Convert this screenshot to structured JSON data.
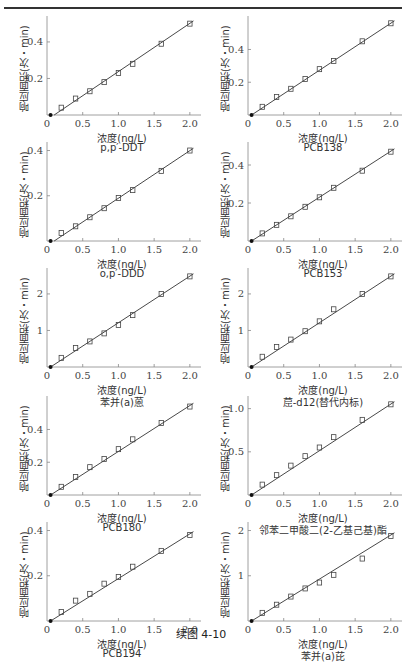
{
  "figure": {
    "caption": "续图 4-10",
    "xlabel": "浓度(ng/L)",
    "ylabel": "响应面积(次・min)"
  },
  "colors": {
    "line": "#333333",
    "marker": "#444444",
    "axis": "#888888",
    "text": "#333333"
  },
  "chart_data": [
    {
      "type": "scatter",
      "title": "p,p′-DDT",
      "xlabel": "浓度(ng/L)",
      "ylabel": "响应面积(次・min)",
      "xlim": [
        0,
        2.1
      ],
      "ylim": [
        0,
        0.52
      ],
      "xticks": [
        0,
        0.5,
        1.0,
        1.5,
        2.0
      ],
      "xtick_labels": [
        "0",
        "0.5",
        "1.0",
        "1.5",
        "2.0"
      ],
      "yticks": [
        0.2,
        0.4
      ],
      "ytick_labels": [
        "0.2",
        "0.4"
      ],
      "x": [
        0.2,
        0.4,
        0.6,
        0.8,
        1.0,
        1.2,
        1.6,
        2.0
      ],
      "y": [
        0.04,
        0.09,
        0.13,
        0.18,
        0.23,
        0.28,
        0.39,
        0.5
      ],
      "fit_line": {
        "x": [
          0.1,
          2.05
        ],
        "y": [
          0.0,
          0.515
        ]
      },
      "origin_point": [
        0.05,
        0.0
      ]
    },
    {
      "type": "scatter",
      "title": "PCB138",
      "xlabel": "浓度(ng/L)",
      "ylabel": "响应面积(次・min)",
      "xlim": [
        0,
        2.1
      ],
      "ylim": [
        0,
        0.58
      ],
      "xticks": [
        0,
        0.5,
        1.0,
        1.5,
        2.0
      ],
      "xtick_labels": [
        "0",
        "0.5",
        "1.0",
        "1.5",
        "2.0"
      ],
      "yticks": [
        0.2,
        0.4
      ],
      "ytick_labels": [
        "0.2",
        "0.4"
      ],
      "x": [
        0.2,
        0.4,
        0.6,
        0.8,
        1.0,
        1.2,
        1.6,
        2.0
      ],
      "y": [
        0.05,
        0.11,
        0.16,
        0.22,
        0.28,
        0.33,
        0.45,
        0.56
      ],
      "fit_line": {
        "x": [
          0.05,
          2.05
        ],
        "y": [
          0.0,
          0.575
        ]
      },
      "origin_point": [
        0.05,
        0.0
      ]
    },
    {
      "type": "scatter",
      "title": "o,p′-DDD",
      "xlabel": "浓度(ng/L)",
      "ylabel": "响应面积(次・min)",
      "xlim": [
        0,
        2.1
      ],
      "ylim": [
        0,
        0.42
      ],
      "xticks": [
        0,
        0.5,
        1.0,
        1.5,
        2.0
      ],
      "xtick_labels": [
        "0",
        "0.5",
        "1.0",
        "1.5",
        "2.0"
      ],
      "yticks": [
        0.2,
        0.4
      ],
      "ytick_labels": [
        "0.2",
        "0.4"
      ],
      "x": [
        0.2,
        0.4,
        0.6,
        0.8,
        1.0,
        1.2,
        1.6,
        2.0
      ],
      "y": [
        0.035,
        0.065,
        0.105,
        0.145,
        0.19,
        0.225,
        0.31,
        0.4
      ],
      "fit_line": {
        "x": [
          0.1,
          2.05
        ],
        "y": [
          0.0,
          0.41
        ]
      },
      "origin_point": [
        0.05,
        0.0
      ]
    },
    {
      "type": "scatter",
      "title": "PCB153",
      "xlabel": "浓度(ng/L)",
      "ylabel": "响应面积(次・min)",
      "xlim": [
        0,
        2.1
      ],
      "ylim": [
        0,
        0.5
      ],
      "xticks": [
        0,
        0.5,
        1.0,
        1.5,
        2.0
      ],
      "xtick_labels": [
        "0",
        "0.5",
        "1.0",
        "1.5",
        "2.0"
      ],
      "yticks": [
        0.2,
        0.4
      ],
      "ytick_labels": [
        "0.2",
        "0.4"
      ],
      "x": [
        0.2,
        0.4,
        0.6,
        0.8,
        1.0,
        1.2,
        1.6,
        2.0
      ],
      "y": [
        0.04,
        0.085,
        0.13,
        0.18,
        0.23,
        0.28,
        0.37,
        0.47
      ],
      "fit_line": {
        "x": [
          0.05,
          2.05
        ],
        "y": [
          0.0,
          0.485
        ]
      },
      "origin_point": [
        0.05,
        0.0
      ]
    },
    {
      "type": "scatter",
      "title": "苯并(a)蒽",
      "xlabel": "浓度(ng/L)",
      "ylabel": "响应面积(次・min)",
      "xlim": [
        0,
        2.1
      ],
      "ylim": [
        0,
        2.6
      ],
      "xticks": [
        0,
        0.5,
        1.0,
        1.5,
        2.0
      ],
      "xtick_labels": [
        "0",
        "0.5",
        "1.0",
        "1.5",
        "2.0"
      ],
      "yticks": [
        1,
        2
      ],
      "ytick_labels": [
        "1",
        "2"
      ],
      "x": [
        0.2,
        0.4,
        0.6,
        0.8,
        1.0,
        1.2,
        1.6,
        2.0
      ],
      "y": [
        0.25,
        0.52,
        0.7,
        0.92,
        1.15,
        1.42,
        2.0,
        2.48
      ],
      "fit_line": {
        "x": [
          0.05,
          2.05
        ],
        "y": [
          0.0,
          2.55
        ]
      },
      "origin_point": [
        0.05,
        0.0
      ]
    },
    {
      "type": "scatter",
      "title": "䓛-d12(替代内标)",
      "xlabel": "浓度(ng/L)",
      "ylabel": "响应面积(次・min)",
      "xlim": [
        0,
        2.1
      ],
      "ylim": [
        0,
        2.6
      ],
      "xticks": [
        0,
        0.5,
        1.0,
        1.5,
        2.0
      ],
      "xtick_labels": [
        "0",
        "0.5",
        "1.0",
        "1.5",
        "2.0"
      ],
      "yticks": [
        1,
        2
      ],
      "ytick_labels": [
        "1",
        "2"
      ],
      "x": [
        0.2,
        0.4,
        0.6,
        0.8,
        1.0,
        1.2,
        1.6,
        2.0
      ],
      "y": [
        0.28,
        0.55,
        0.75,
        0.98,
        1.25,
        1.58,
        2.0,
        2.48
      ],
      "fit_line": {
        "x": [
          0.05,
          2.05
        ],
        "y": [
          0.0,
          2.55
        ]
      },
      "origin_point": [
        0.05,
        0.0
      ]
    },
    {
      "type": "scatter",
      "title": "PCB180",
      "xlabel": "浓度(ng/L)",
      "ylabel": "响应面积(次・min)",
      "xlim": [
        0,
        2.1
      ],
      "ylim": [
        0,
        0.58
      ],
      "xticks": [
        0,
        0.5,
        1.0,
        1.5,
        2.0
      ],
      "xtick_labels": [
        "0",
        "0.5",
        "1.0",
        "1.5",
        "2.0"
      ],
      "yticks": [
        0.2,
        0.4
      ],
      "ytick_labels": [
        "0.2",
        "0.4"
      ],
      "x": [
        0.2,
        0.4,
        0.6,
        0.8,
        1.0,
        1.2,
        1.6,
        2.0
      ],
      "y": [
        0.05,
        0.11,
        0.17,
        0.22,
        0.28,
        0.34,
        0.44,
        0.54
      ],
      "fit_line": {
        "x": [
          0.05,
          2.05
        ],
        "y": [
          0.0,
          0.56
        ]
      },
      "origin_point": [
        0.05,
        0.0
      ]
    },
    {
      "type": "scatter",
      "title": "邻苯二甲酸二(2-乙基己基)酯",
      "xlabel": "浓度(ng/L)",
      "ylabel": "响应面积(次・min)",
      "xlim": [
        0,
        2.1
      ],
      "ylim": [
        0,
        1.1
      ],
      "xticks": [
        0,
        0.5,
        1.0,
        1.5,
        2.0
      ],
      "xtick_labels": [
        "0",
        "0.5",
        "1.0",
        "1.5",
        "2.0"
      ],
      "yticks": [
        0.5,
        1.0
      ],
      "ytick_labels": [
        "0.5",
        "1.0"
      ],
      "x": [
        0.2,
        0.4,
        0.6,
        0.8,
        1.0,
        1.2,
        1.6,
        2.0
      ],
      "y": [
        0.12,
        0.23,
        0.34,
        0.45,
        0.55,
        0.67,
        0.87,
        1.05
      ],
      "fit_line": {
        "x": [
          0.05,
          2.05
        ],
        "y": [
          0.0,
          1.08
        ]
      },
      "origin_point": [
        0.05,
        0.0
      ]
    },
    {
      "type": "scatter",
      "title": "PCB194",
      "xlabel": "浓度(ng/L)",
      "ylabel": "响应面积(次・min)",
      "xlim": [
        0,
        2.1
      ],
      "ylim": [
        0,
        0.42
      ],
      "xticks": [
        0,
        0.5,
        1.0,
        1.5,
        2.0
      ],
      "xtick_labels": [
        "0",
        "0.5",
        "1.0",
        "1.5",
        "2.0"
      ],
      "yticks": [
        0.2,
        0.4
      ],
      "ytick_labels": [
        "0.2",
        "0.4"
      ],
      "x": [
        0.2,
        0.4,
        0.6,
        0.8,
        1.0,
        1.2,
        1.6,
        2.0
      ],
      "y": [
        0.04,
        0.09,
        0.12,
        0.165,
        0.195,
        0.24,
        0.31,
        0.38
      ],
      "fit_line": {
        "x": [
          0.05,
          2.05
        ],
        "y": [
          0.0,
          0.395
        ]
      },
      "origin_point": [
        0.05,
        0.0
      ]
    },
    {
      "type": "scatter",
      "title": "苯并(a)芘",
      "xlabel": "浓度(ng/L)",
      "ylabel": "响应面积(次・min)",
      "xlim": [
        0,
        2.1
      ],
      "ylim": [
        0,
        2.1
      ],
      "xticks": [
        0,
        0.5,
        1.0,
        1.5,
        2.0
      ],
      "xtick_labels": [
        "0",
        "0.5",
        "1.0",
        "1.5",
        "2.0"
      ],
      "yticks": [
        1,
        2
      ],
      "ytick_labels": [
        "1",
        "2"
      ],
      "x": [
        0.2,
        0.4,
        0.6,
        0.8,
        1.0,
        1.2,
        1.6,
        2.0
      ],
      "y": [
        0.18,
        0.36,
        0.54,
        0.72,
        0.85,
        1.02,
        1.38,
        1.88
      ],
      "fit_line": {
        "x": [
          0.05,
          2.05
        ],
        "y": [
          0.0,
          1.95
        ]
      },
      "origin_point": [
        0.05,
        0.0
      ]
    }
  ]
}
